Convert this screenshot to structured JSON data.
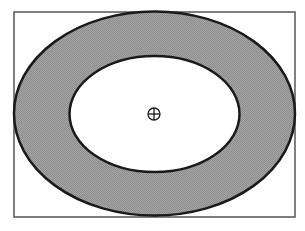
{
  "diagram": {
    "type": "elliptical-annulus",
    "frame": {
      "x": 14,
      "y": 12,
      "width": 281,
      "height": 205,
      "stroke": "#555555"
    },
    "outer_ellipse": {
      "cx": 154.5,
      "cy": 113.5,
      "rx": 140.5,
      "ry": 102,
      "fill": "#9a9a9a",
      "stroke": "#1a1a1a"
    },
    "inner_ellipse": {
      "cx": 154.5,
      "cy": 114,
      "rx": 85,
      "ry": 58,
      "fill": "#ffffff",
      "stroke": "#1a1a1a"
    },
    "center_marker": {
      "cx": 154,
      "cy": 114,
      "r": 6,
      "icon": "crosshair-circle-icon",
      "stroke": "#1a1a1a"
    }
  }
}
